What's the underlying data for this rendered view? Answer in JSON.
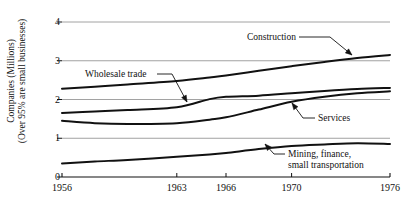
{
  "chart_data": {
    "type": "line",
    "title": "",
    "subtitle": "",
    "xlabel": "",
    "ylabel": "Companies (Millions) (Over 95% are small businesses)",
    "ylabel_line1": "Companies (Millions)",
    "ylabel_line2": "(Over 95% are small businesses)",
    "xlim": [
      1956,
      1976
    ],
    "ylim": [
      0,
      4
    ],
    "xticks": [
      1956,
      1963,
      1966,
      1970,
      1976
    ],
    "xtick_labels": [
      "1956",
      "1963",
      "1966",
      "1970",
      "1976"
    ],
    "yticks": [
      0,
      1,
      2,
      3,
      4
    ],
    "ytick_labels": [
      "0",
      "1",
      "2",
      "3",
      "4"
    ],
    "grid": "horizontal",
    "legend": "none (direct annotations with arrows)",
    "x": [
      1956,
      1958,
      1960,
      1963,
      1965,
      1966,
      1968,
      1970,
      1972,
      1974,
      1976
    ],
    "series": [
      {
        "name": "Construction",
        "values": [
          2.28,
          2.33,
          2.39,
          2.48,
          2.57,
          2.62,
          2.74,
          2.86,
          2.97,
          3.07,
          3.15
        ]
      },
      {
        "name": "Wholesale trade",
        "values": [
          1.65,
          1.69,
          1.73,
          1.8,
          2.01,
          2.07,
          2.1,
          2.16,
          2.22,
          2.27,
          2.3
        ]
      },
      {
        "name": "Services",
        "values": [
          1.45,
          1.39,
          1.37,
          1.39,
          1.48,
          1.54,
          1.74,
          1.94,
          2.07,
          2.16,
          2.21
        ]
      },
      {
        "name": "Mining, finance, small transportation",
        "values": [
          0.35,
          0.4,
          0.44,
          0.52,
          0.58,
          0.62,
          0.72,
          0.8,
          0.84,
          0.87,
          0.85
        ]
      }
    ],
    "annotations": [
      {
        "label": "Construction",
        "label_lines": [
          "Construction"
        ],
        "text_x": 296,
        "text_y": 40,
        "anchor": "end",
        "leader_from_x": 299,
        "leader_from_y": 37,
        "leader_mid_x": 330,
        "leader_mid_y": 37,
        "point_x": 352,
        "point_y": 55
      },
      {
        "label": "Wholesale trade",
        "label_lines": [
          "Wholesale trade"
        ],
        "text_x": 85,
        "text_y": 77,
        "anchor": "start",
        "leader_from_x": 157,
        "leader_from_y": 74,
        "leader_mid_x": 172,
        "leader_mid_y": 74,
        "point_x": 187,
        "point_y": 102
      },
      {
        "label": "Services",
        "label_lines": [
          "Services"
        ],
        "text_x": 318,
        "text_y": 121,
        "anchor": "start",
        "leader_from_x": 315,
        "leader_from_y": 118,
        "leader_mid_x": 303,
        "leader_mid_y": 118,
        "point_x": 292,
        "point_y": 103
      },
      {
        "label": "Mining, finance, small transportation",
        "label_lines": [
          "Mining, finance,",
          "small transportation"
        ],
        "text_x": 288,
        "text_y": 157,
        "anchor": "start",
        "leader_from_x": 285,
        "leader_from_y": 154,
        "leader_mid_x": 274,
        "leader_mid_y": 154,
        "point_x": 265,
        "point_y": 144
      }
    ],
    "colors": {
      "line": "#111111",
      "grid": "#8a8a8a",
      "axis": "#111111",
      "background": "#ffffff",
      "text": "#111111"
    }
  }
}
